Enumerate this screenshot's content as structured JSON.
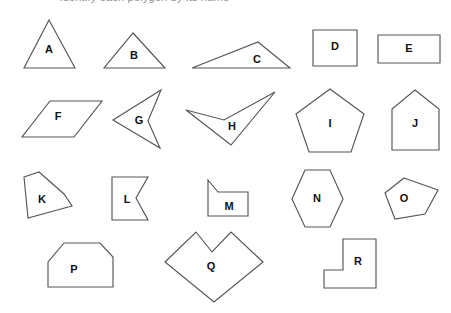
{
  "page": {
    "background_color": "#ffffff",
    "stroke_color": "#555558",
    "label_color": "#111114",
    "clipped_header_text": "identify each polygon by its name"
  },
  "shapes": [
    {
      "label": "A",
      "name": "equilateral-triangle",
      "category": "triangle",
      "sides": 3,
      "convex": true,
      "label_x": 49,
      "label_y": 50,
      "points": "49,20 75,68 24,68"
    },
    {
      "label": "B",
      "name": "isosceles-triangle",
      "category": "triangle",
      "sides": 3,
      "convex": true,
      "label_x": 134,
      "label_y": 56,
      "points": "133,33 165,68 104,68"
    },
    {
      "label": "C",
      "name": "obtuse-scalene-triangle",
      "category": "triangle",
      "sides": 3,
      "convex": true,
      "label_x": 257,
      "label_y": 60,
      "points": "258,42 290,68 192,68"
    },
    {
      "label": "D",
      "name": "square",
      "category": "quadrilateral",
      "sides": 4,
      "convex": true,
      "label_x": 335,
      "label_y": 47,
      "points": "313,30 357,30 357,66 313,66"
    },
    {
      "label": "E",
      "name": "rectangle",
      "category": "quadrilateral",
      "sides": 4,
      "convex": true,
      "label_x": 409,
      "label_y": 49,
      "points": "378,35 440,35 440,63 378,63"
    },
    {
      "label": "F",
      "name": "parallelogram",
      "category": "quadrilateral",
      "sides": 4,
      "convex": true,
      "label_x": 58,
      "label_y": 117,
      "points": "50,101 102,101 74,137 22,137"
    },
    {
      "label": "G",
      "name": "concave-dart-quadrilateral",
      "category": "quadrilateral",
      "sides": 4,
      "convex": false,
      "label_x": 139,
      "label_y": 121,
      "points": "113,120 161,90 148,121 160,148"
    },
    {
      "label": "H",
      "name": "concave-arrowhead-quadrilateral",
      "category": "quadrilateral",
      "sides": 4,
      "convex": false,
      "label_x": 232,
      "label_y": 127,
      "points": "186,110 224,120 275,92 231,145"
    },
    {
      "label": "I",
      "name": "regular-pentagon",
      "category": "pentagon",
      "sides": 5,
      "convex": true,
      "label_x": 330,
      "label_y": 124,
      "points": "330,89 364,114 351,152 309,152 296,114"
    },
    {
      "label": "J",
      "name": "house-pentagon",
      "category": "pentagon",
      "sides": 5,
      "convex": true,
      "label_x": 415,
      "label_y": 124,
      "points": "415,90 439,109 439,150 392,150 392,109"
    },
    {
      "label": "K",
      "name": "irregular-pentagon",
      "category": "pentagon",
      "sides": 5,
      "convex": true,
      "label_x": 42,
      "label_y": 200,
      "points": "24,177 39,172 64,194 72,206 28,218"
    },
    {
      "label": "L",
      "name": "concave-notched-rectangle",
      "category": "pentagon",
      "sides": 5,
      "convex": false,
      "label_x": 127,
      "label_y": 200,
      "points": "112,177 148,177 136,198 148,220 112,220"
    },
    {
      "label": "M",
      "name": "clipped-corner-pentagon",
      "category": "pentagon",
      "sides": 5,
      "convex": true,
      "label_x": 229,
      "label_y": 207,
      "points": "208,180 218,192 248,192 248,216 208,216"
    },
    {
      "label": "N",
      "name": "regular-hexagon",
      "category": "hexagon",
      "sides": 6,
      "convex": true,
      "label_x": 317,
      "label_y": 199,
      "points": "305,170 330,170 343,199 330,227 305,227 292,199"
    },
    {
      "label": "O",
      "name": "irregular-pentagon-rounded",
      "category": "pentagon",
      "sides": 5,
      "convex": true,
      "label_x": 404,
      "label_y": 199,
      "points": "404,178 438,190 425,214 395,219 385,193"
    },
    {
      "label": "P",
      "name": "clipped-corner-hexagon",
      "category": "hexagon",
      "sides": 6,
      "convex": true,
      "label_x": 74,
      "label_y": 270,
      "points": "64,243 100,243 113,257 113,287 48,287 48,262"
    },
    {
      "label": "Q",
      "name": "concave-heart-hexagon",
      "category": "hexagon",
      "sides": 6,
      "convex": false,
      "label_x": 211,
      "label_y": 267,
      "points": "196,232 212,252 231,232 263,262 214,302 165,262"
    },
    {
      "label": "R",
      "name": "l-shaped-hexagon",
      "category": "hexagon",
      "sides": 6,
      "convex": false,
      "label_x": 358,
      "label_y": 262,
      "points": "343,239 376,239 376,288 324,288 324,270 343,270"
    }
  ]
}
